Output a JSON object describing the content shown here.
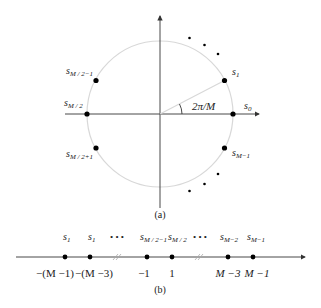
{
  "figure_a": {
    "caption": "(a)",
    "angle_label": "2π/M",
    "points": [
      {
        "id": "s0",
        "base": "s",
        "sub": "0"
      },
      {
        "id": "s1",
        "base": "s",
        "sub": "1"
      },
      {
        "id": "sM2m1",
        "base": "s",
        "sub": "M / 2−1"
      },
      {
        "id": "sM2",
        "base": "s",
        "sub": "M / 2"
      },
      {
        "id": "sM2p1",
        "base": "s",
        "sub": "M / 2+1"
      },
      {
        "id": "sMm1",
        "base": "s",
        "sub": "M−1"
      }
    ],
    "colors": {
      "circle": "#d8d8d8",
      "axis": "#333333",
      "point": "#000000"
    }
  },
  "figure_b": {
    "caption": "(b)",
    "ellipsis": "• • •",
    "points": [
      {
        "base": "s",
        "sub": "1",
        "value": "−(M −1)"
      },
      {
        "base": "s",
        "sub": "1",
        "value": "−(M −3)"
      },
      {
        "base": "s",
        "sub": "M / 2−1",
        "value": "−1"
      },
      {
        "base": "s",
        "sub": "M / 2",
        "value": "1"
      },
      {
        "base": "s",
        "sub": "M−2",
        "value": "M −3"
      },
      {
        "base": "s",
        "sub": "M−1",
        "value": "M −1"
      }
    ]
  }
}
